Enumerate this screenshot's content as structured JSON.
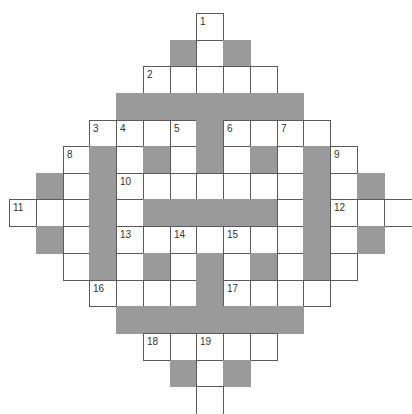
{
  "puzzle": {
    "type": "crossword",
    "rows": 15,
    "cols": 15,
    "colors": {
      "white": "#ffffff",
      "dark": "#9a9a9a",
      "border": "#5a5a5a",
      "number": "#333333"
    },
    "layout": {
      "col_x": [
        9,
        36,
        63,
        89,
        116,
        143,
        170,
        196,
        223,
        250,
        277,
        303,
        330,
        357,
        384,
        411
      ],
      "row_y": [
        13,
        40,
        66,
        93,
        120,
        146,
        173,
        199,
        226,
        253,
        280,
        306,
        333,
        360,
        386,
        413
      ]
    },
    "cells": [
      {
        "r": 0,
        "c": 7,
        "t": "w",
        "n": "1"
      },
      {
        "r": 1,
        "c": 6,
        "t": "d"
      },
      {
        "r": 1,
        "c": 7,
        "t": "w"
      },
      {
        "r": 1,
        "c": 8,
        "t": "d"
      },
      {
        "r": 2,
        "c": 5,
        "t": "w",
        "n": "2"
      },
      {
        "r": 2,
        "c": 6,
        "t": "w"
      },
      {
        "r": 2,
        "c": 7,
        "t": "w"
      },
      {
        "r": 2,
        "c": 8,
        "t": "w"
      },
      {
        "r": 2,
        "c": 9,
        "t": "w"
      },
      {
        "r": 3,
        "c": 4,
        "t": "d"
      },
      {
        "r": 3,
        "c": 5,
        "t": "d"
      },
      {
        "r": 3,
        "c": 6,
        "t": "d"
      },
      {
        "r": 3,
        "c": 7,
        "t": "d"
      },
      {
        "r": 3,
        "c": 8,
        "t": "d"
      },
      {
        "r": 3,
        "c": 9,
        "t": "d"
      },
      {
        "r": 3,
        "c": 10,
        "t": "d"
      },
      {
        "r": 4,
        "c": 3,
        "t": "w",
        "n": "3"
      },
      {
        "r": 4,
        "c": 4,
        "t": "w",
        "n": "4"
      },
      {
        "r": 4,
        "c": 5,
        "t": "w"
      },
      {
        "r": 4,
        "c": 6,
        "t": "w",
        "n": "5"
      },
      {
        "r": 4,
        "c": 7,
        "t": "d"
      },
      {
        "r": 4,
        "c": 8,
        "t": "w",
        "n": "6"
      },
      {
        "r": 4,
        "c": 9,
        "t": "w"
      },
      {
        "r": 4,
        "c": 10,
        "t": "w",
        "n": "7"
      },
      {
        "r": 4,
        "c": 11,
        "t": "w"
      },
      {
        "r": 5,
        "c": 2,
        "t": "w",
        "n": "8"
      },
      {
        "r": 5,
        "c": 3,
        "t": "d"
      },
      {
        "r": 5,
        "c": 4,
        "t": "w"
      },
      {
        "r": 5,
        "c": 5,
        "t": "d"
      },
      {
        "r": 5,
        "c": 6,
        "t": "w"
      },
      {
        "r": 5,
        "c": 7,
        "t": "d"
      },
      {
        "r": 5,
        "c": 8,
        "t": "w"
      },
      {
        "r": 5,
        "c": 9,
        "t": "d"
      },
      {
        "r": 5,
        "c": 10,
        "t": "w"
      },
      {
        "r": 5,
        "c": 11,
        "t": "d"
      },
      {
        "r": 5,
        "c": 12,
        "t": "w",
        "n": "9"
      },
      {
        "r": 6,
        "c": 1,
        "t": "d"
      },
      {
        "r": 6,
        "c": 2,
        "t": "w"
      },
      {
        "r": 6,
        "c": 3,
        "t": "d"
      },
      {
        "r": 6,
        "c": 4,
        "t": "w",
        "n": "10"
      },
      {
        "r": 6,
        "c": 5,
        "t": "w"
      },
      {
        "r": 6,
        "c": 6,
        "t": "w"
      },
      {
        "r": 6,
        "c": 7,
        "t": "w"
      },
      {
        "r": 6,
        "c": 8,
        "t": "w"
      },
      {
        "r": 6,
        "c": 9,
        "t": "w"
      },
      {
        "r": 6,
        "c": 10,
        "t": "w"
      },
      {
        "r": 6,
        "c": 11,
        "t": "d"
      },
      {
        "r": 6,
        "c": 12,
        "t": "w"
      },
      {
        "r": 6,
        "c": 13,
        "t": "d"
      },
      {
        "r": 7,
        "c": 0,
        "t": "w",
        "n": "11"
      },
      {
        "r": 7,
        "c": 1,
        "t": "w"
      },
      {
        "r": 7,
        "c": 2,
        "t": "w"
      },
      {
        "r": 7,
        "c": 3,
        "t": "d"
      },
      {
        "r": 7,
        "c": 4,
        "t": "w"
      },
      {
        "r": 7,
        "c": 5,
        "t": "d"
      },
      {
        "r": 7,
        "c": 6,
        "t": "d"
      },
      {
        "r": 7,
        "c": 7,
        "t": "d"
      },
      {
        "r": 7,
        "c": 8,
        "t": "d"
      },
      {
        "r": 7,
        "c": 9,
        "t": "d"
      },
      {
        "r": 7,
        "c": 10,
        "t": "w"
      },
      {
        "r": 7,
        "c": 11,
        "t": "d"
      },
      {
        "r": 7,
        "c": 12,
        "t": "w",
        "n": "12"
      },
      {
        "r": 7,
        "c": 13,
        "t": "w"
      },
      {
        "r": 7,
        "c": 14,
        "t": "w",
        "open": "right"
      },
      {
        "r": 8,
        "c": 1,
        "t": "d"
      },
      {
        "r": 8,
        "c": 2,
        "t": "w"
      },
      {
        "r": 8,
        "c": 3,
        "t": "d"
      },
      {
        "r": 8,
        "c": 4,
        "t": "w",
        "n": "13"
      },
      {
        "r": 8,
        "c": 5,
        "t": "w"
      },
      {
        "r": 8,
        "c": 6,
        "t": "w",
        "n": "14"
      },
      {
        "r": 8,
        "c": 7,
        "t": "w"
      },
      {
        "r": 8,
        "c": 8,
        "t": "w",
        "n": "15"
      },
      {
        "r": 8,
        "c": 9,
        "t": "w"
      },
      {
        "r": 8,
        "c": 10,
        "t": "w"
      },
      {
        "r": 8,
        "c": 11,
        "t": "d"
      },
      {
        "r": 8,
        "c": 12,
        "t": "w"
      },
      {
        "r": 8,
        "c": 13,
        "t": "d"
      },
      {
        "r": 9,
        "c": 2,
        "t": "w"
      },
      {
        "r": 9,
        "c": 3,
        "t": "d"
      },
      {
        "r": 9,
        "c": 4,
        "t": "w"
      },
      {
        "r": 9,
        "c": 5,
        "t": "d"
      },
      {
        "r": 9,
        "c": 6,
        "t": "w"
      },
      {
        "r": 9,
        "c": 7,
        "t": "d"
      },
      {
        "r": 9,
        "c": 8,
        "t": "w"
      },
      {
        "r": 9,
        "c": 9,
        "t": "d"
      },
      {
        "r": 9,
        "c": 10,
        "t": "w"
      },
      {
        "r": 9,
        "c": 11,
        "t": "d"
      },
      {
        "r": 9,
        "c": 12,
        "t": "w"
      },
      {
        "r": 10,
        "c": 3,
        "t": "w",
        "n": "16"
      },
      {
        "r": 10,
        "c": 4,
        "t": "w"
      },
      {
        "r": 10,
        "c": 5,
        "t": "w"
      },
      {
        "r": 10,
        "c": 6,
        "t": "w"
      },
      {
        "r": 10,
        "c": 7,
        "t": "d"
      },
      {
        "r": 10,
        "c": 8,
        "t": "w",
        "n": "17"
      },
      {
        "r": 10,
        "c": 9,
        "t": "w"
      },
      {
        "r": 10,
        "c": 10,
        "t": "w"
      },
      {
        "r": 10,
        "c": 11,
        "t": "w"
      },
      {
        "r": 11,
        "c": 4,
        "t": "d"
      },
      {
        "r": 11,
        "c": 5,
        "t": "d"
      },
      {
        "r": 11,
        "c": 6,
        "t": "d"
      },
      {
        "r": 11,
        "c": 7,
        "t": "d"
      },
      {
        "r": 11,
        "c": 8,
        "t": "d"
      },
      {
        "r": 11,
        "c": 9,
        "t": "d"
      },
      {
        "r": 11,
        "c": 10,
        "t": "d"
      },
      {
        "r": 12,
        "c": 5,
        "t": "w",
        "n": "18"
      },
      {
        "r": 12,
        "c": 6,
        "t": "w"
      },
      {
        "r": 12,
        "c": 7,
        "t": "w",
        "n": "19"
      },
      {
        "r": 12,
        "c": 8,
        "t": "w"
      },
      {
        "r": 12,
        "c": 9,
        "t": "w"
      },
      {
        "r": 13,
        "c": 6,
        "t": "d"
      },
      {
        "r": 13,
        "c": 7,
        "t": "w"
      },
      {
        "r": 13,
        "c": 8,
        "t": "d"
      },
      {
        "r": 14,
        "c": 7,
        "t": "w",
        "open": "bottom"
      }
    ]
  }
}
